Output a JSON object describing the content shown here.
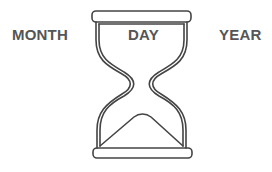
{
  "labels": {
    "month": "MONTH",
    "day": "DAY",
    "year": "YEAR"
  },
  "icon": "hourglass-icon",
  "colors": {
    "stroke": "#444444",
    "text": "#555555",
    "background": "#ffffff"
  }
}
